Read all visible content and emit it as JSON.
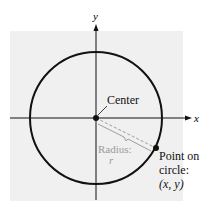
{
  "diagram": {
    "axes": {
      "x_label": "x",
      "y_label": "y"
    },
    "center_label": "Center",
    "radius_label": "Radius:",
    "radius_symbol": "r",
    "point_label_line1": "Point on",
    "point_label_line2": "circle:",
    "point_label_line3": "(x, y)",
    "colors": {
      "background": "#f0f0f0",
      "stroke": "#111111",
      "radius_text": "#9a9a9a"
    }
  }
}
